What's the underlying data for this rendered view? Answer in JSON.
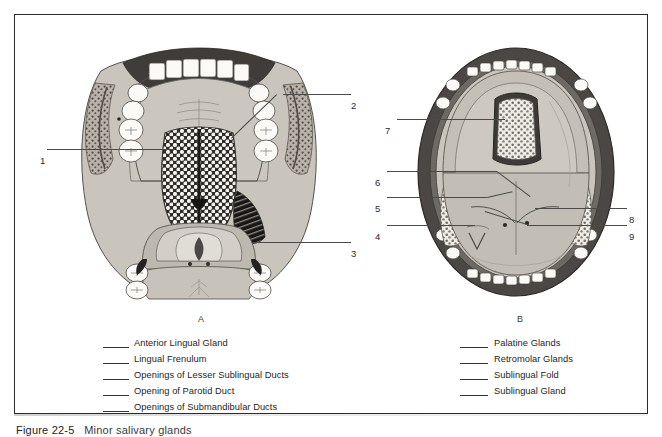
{
  "figure": {
    "caption_number": "Figure 22-5",
    "caption_text": "Minor salivary glands"
  },
  "panels": [
    {
      "id": "A",
      "letter": "A"
    },
    {
      "id": "B",
      "letter": "B"
    }
  ],
  "callouts_a": [
    {
      "number": "1"
    },
    {
      "number": "2"
    },
    {
      "number": "3"
    }
  ],
  "callouts_b": [
    {
      "number": "4"
    },
    {
      "number": "5"
    },
    {
      "number": "6"
    },
    {
      "number": "7"
    },
    {
      "number": "8"
    },
    {
      "number": "9"
    }
  ],
  "legend_a": {
    "items": [
      {
        "label": "Anterior Lingual Gland"
      },
      {
        "label": "Lingual Frenulum"
      },
      {
        "label": "Openings of Lesser Sublingual Ducts"
      },
      {
        "label": "Opening of Parotid Duct"
      },
      {
        "label": "Openings of Submandibular Ducts"
      }
    ]
  },
  "legend_b": {
    "items": [
      {
        "label": "Palatine Glands"
      },
      {
        "label": "Retromolar Glands"
      },
      {
        "label": "Sublingual Fold"
      },
      {
        "label": "Sublingual Gland"
      }
    ]
  },
  "colors": {
    "border": "#2b2b2b",
    "ink": "#1e1e1e",
    "leader": "#4a4a4a",
    "tissue_light": "#cfcbc4",
    "tissue_mid": "#a9a49c",
    "tissue_dark": "#6e6a64",
    "lip_dark": "#4a4744",
    "tooth": "#fbfaf7"
  }
}
